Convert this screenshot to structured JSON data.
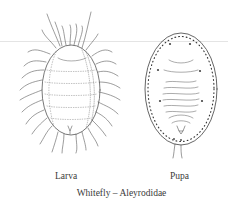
{
  "figure": {
    "title": "Whitefly – Aleyrodidae",
    "panels": [
      {
        "id": "larva",
        "label": "Larva"
      },
      {
        "id": "pupa",
        "label": "Pupa"
      }
    ]
  },
  "colors": {
    "line": "#555555",
    "background": "#ffffff",
    "rule": "#e4e4e4"
  }
}
